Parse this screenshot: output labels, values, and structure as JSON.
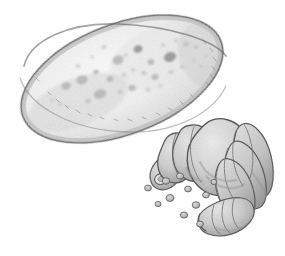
{
  "artwork": {
    "title": "Potato tuber with grub larvae and frass pellets",
    "medium": "graphite pencil illustration",
    "style": "scientific-line-and-shade",
    "background_color": "#ffffff",
    "canvas": {
      "width": 285,
      "height": 256
    },
    "alt_text": "Pencil drawing of a spotted oval potato tuber above a cluster of pale segmented grub larvae surrounded by small round pellets"
  },
  "palette": {
    "paper": "#ffffff",
    "tuber_fill_light": "#f4f4f4",
    "tuber_fill_mid": "#e6e6e6",
    "tuber_outline": "#6e6e6e",
    "tuber_spot": "#b4b4b4",
    "tuber_spot_dark": "#9a9a9a",
    "grub_fill_light": "#e3e3e3",
    "grub_fill_mid": "#c9c9c9",
    "grub_fill_dark": "#a8a8a8",
    "grub_outline": "#5f5f5f",
    "pellet_fill": "#c4c4c4",
    "pellet_outline": "#6b6b6b"
  },
  "subjects": [
    {
      "id": "tuber",
      "name": "potato-tuber",
      "label": "Potato tuber",
      "description": "Large tilted oval tuber with stippled skin and darker sunken eyes",
      "bounds": {
        "x": 16,
        "y": 18,
        "width": 212,
        "height": 124
      },
      "rotation_deg": -21,
      "spot_count": 34
    },
    {
      "id": "grub-main",
      "name": "grub-larva-large",
      "label": "Large grub larva",
      "description": "Plump C-shaped segmented larva with banded abdomen and small head capsule",
      "bounds": {
        "x": 150,
        "y": 118,
        "width": 124,
        "height": 96
      },
      "segment_count": 7
    },
    {
      "id": "grub-small",
      "name": "grub-larva-small",
      "label": "Small grub larva",
      "description": "Smaller segmented larva lying below the large grub, head pointing left",
      "bounds": {
        "x": 196,
        "y": 196,
        "width": 62,
        "height": 40
      },
      "segment_count": 5
    },
    {
      "id": "frass",
      "name": "frass-pellets",
      "label": "Frass pellets",
      "description": "Scattered small round droppings between and below the larvae",
      "count": 11
    }
  ],
  "tuber_spots": [
    {
      "cx": 138,
      "cy": 49,
      "rx": 4.6,
      "ry": 3.6,
      "rot": -20,
      "tone": "dark"
    },
    {
      "cx": 118,
      "cy": 60,
      "rx": 5.6,
      "ry": 4.4,
      "rot": -18,
      "tone": "mid"
    },
    {
      "cx": 151,
      "cy": 62,
      "rx": 3.4,
      "ry": 2.8,
      "rot": -15,
      "tone": "mid"
    },
    {
      "cx": 170,
      "cy": 57,
      "rx": 6.2,
      "ry": 4.8,
      "rot": -22,
      "tone": "dark"
    },
    {
      "cx": 186,
      "cy": 44,
      "rx": 3.0,
      "ry": 2.4,
      "rot": -10,
      "tone": "light"
    },
    {
      "cx": 196,
      "cy": 47,
      "rx": 2.3,
      "ry": 1.9,
      "rot": -10,
      "tone": "light"
    },
    {
      "cx": 176,
      "cy": 41,
      "rx": 2.0,
      "ry": 1.7,
      "rot": 0,
      "tone": "light"
    },
    {
      "cx": 163,
      "cy": 45,
      "rx": 2.2,
      "ry": 1.8,
      "rot": 0,
      "tone": "light"
    },
    {
      "cx": 104,
      "cy": 47,
      "rx": 2.6,
      "ry": 2.1,
      "rot": -14,
      "tone": "light"
    },
    {
      "cx": 96,
      "cy": 72,
      "rx": 2.9,
      "ry": 2.3,
      "rot": -14,
      "tone": "mid"
    },
    {
      "cx": 82,
      "cy": 80,
      "rx": 5.6,
      "ry": 4.4,
      "rot": -18,
      "tone": "mid"
    },
    {
      "cx": 66,
      "cy": 86,
      "rx": 4.6,
      "ry": 3.6,
      "rot": -18,
      "tone": "mid"
    },
    {
      "cx": 78,
      "cy": 66,
      "rx": 2.4,
      "ry": 2.0,
      "rot": 0,
      "tone": "light"
    },
    {
      "cx": 110,
      "cy": 79,
      "rx": 3.4,
      "ry": 2.8,
      "rot": -12,
      "tone": "mid"
    },
    {
      "cx": 124,
      "cy": 75,
      "rx": 2.6,
      "ry": 2.1,
      "rot": -12,
      "tone": "light"
    },
    {
      "cx": 133,
      "cy": 70,
      "rx": 2.2,
      "ry": 1.8,
      "rot": 0,
      "tone": "light"
    },
    {
      "cx": 144,
      "cy": 73,
      "rx": 2.8,
      "ry": 2.2,
      "rot": 0,
      "tone": "light"
    },
    {
      "cx": 155,
      "cy": 77,
      "rx": 3.6,
      "ry": 2.8,
      "rot": -14,
      "tone": "mid"
    },
    {
      "cx": 171,
      "cy": 72,
      "rx": 2.6,
      "ry": 2.1,
      "rot": 0,
      "tone": "light"
    },
    {
      "cx": 182,
      "cy": 67,
      "rx": 2.2,
      "ry": 1.8,
      "rot": 0,
      "tone": "light"
    },
    {
      "cx": 100,
      "cy": 94,
      "rx": 6.4,
      "ry": 4.6,
      "rot": -18,
      "tone": "mid"
    },
    {
      "cx": 88,
      "cy": 101,
      "rx": 3.0,
      "ry": 2.4,
      "rot": -18,
      "tone": "light"
    },
    {
      "cx": 120,
      "cy": 92,
      "rx": 2.6,
      "ry": 2.1,
      "rot": 0,
      "tone": "light"
    },
    {
      "cx": 132,
      "cy": 88,
      "rx": 3.8,
      "ry": 3.0,
      "rot": -12,
      "tone": "mid"
    },
    {
      "cx": 148,
      "cy": 90,
      "rx": 2.4,
      "ry": 2.0,
      "rot": 0,
      "tone": "light"
    },
    {
      "cx": 60,
      "cy": 104,
      "rx": 2.2,
      "ry": 1.8,
      "rot": 0,
      "tone": "light"
    },
    {
      "cx": 52,
      "cy": 100,
      "rx": 1.9,
      "ry": 1.6,
      "rot": 0,
      "tone": "light"
    },
    {
      "cx": 68,
      "cy": 107,
      "rx": 1.9,
      "ry": 1.6,
      "rot": 0,
      "tone": "light"
    },
    {
      "cx": 194,
      "cy": 60,
      "rx": 2.0,
      "ry": 1.6,
      "rot": 0,
      "tone": "light"
    },
    {
      "cx": 201,
      "cy": 66,
      "rx": 1.8,
      "ry": 1.5,
      "rot": 0,
      "tone": "light"
    },
    {
      "cx": 206,
      "cy": 56,
      "rx": 1.7,
      "ry": 1.4,
      "rot": 0,
      "tone": "light"
    },
    {
      "cx": 126,
      "cy": 55,
      "rx": 2.1,
      "ry": 1.7,
      "rot": 0,
      "tone": "light"
    },
    {
      "cx": 92,
      "cy": 57,
      "rx": 2.0,
      "ry": 1.6,
      "rot": 0,
      "tone": "light"
    },
    {
      "cx": 160,
      "cy": 86,
      "rx": 2.0,
      "ry": 1.6,
      "rot": 0,
      "tone": "light"
    }
  ],
  "frass_pellets": [
    {
      "cx": 148,
      "cy": 188,
      "r": 3.4
    },
    {
      "cx": 166,
      "cy": 181,
      "r": 3.8
    },
    {
      "cx": 180,
      "cy": 176,
      "r": 3.6
    },
    {
      "cx": 188,
      "cy": 189,
      "r": 3.4
    },
    {
      "cx": 170,
      "cy": 198,
      "r": 4.0
    },
    {
      "cx": 196,
      "cy": 205,
      "r": 3.8
    },
    {
      "cx": 206,
      "cy": 195,
      "r": 3.4
    },
    {
      "cx": 184,
      "cy": 215,
      "r": 3.6
    },
    {
      "cx": 200,
      "cy": 224,
      "r": 3.4
    },
    {
      "cx": 214,
      "cy": 182,
      "r": 3.0
    },
    {
      "cx": 158,
      "cy": 204,
      "r": 3.0
    }
  ],
  "grub_main_segments": [
    {
      "id": "seg-1",
      "label": "head-capsule"
    },
    {
      "id": "seg-2",
      "label": "thorax-front"
    },
    {
      "id": "seg-3",
      "label": "thorax-mid"
    },
    {
      "id": "seg-4",
      "label": "abdomen-hump"
    },
    {
      "id": "seg-5",
      "label": "abdomen-band-1"
    },
    {
      "id": "seg-6",
      "label": "abdomen-band-2"
    },
    {
      "id": "seg-7",
      "label": "abdomen-tail"
    }
  ]
}
